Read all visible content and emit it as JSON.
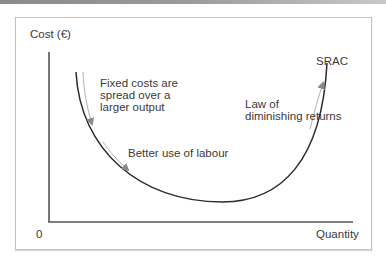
{
  "diagram": {
    "type": "cost-curve",
    "y_axis_label": "Cost (€)",
    "x_axis_label": "Quantity",
    "origin_label": "0",
    "curve_label": "SRAC",
    "annotations": {
      "fixed_costs": "Fixed costs are\nspread over a\nlarger output",
      "better_use": "Better use of labour",
      "diminishing": "Law of\ndiminishing returns"
    },
    "colors": {
      "curve": "#2b2b2b",
      "axes": "#555555",
      "arrows": "#8a8a8a",
      "text": "#3a3a3a",
      "frame": "#c4c4c4"
    }
  }
}
